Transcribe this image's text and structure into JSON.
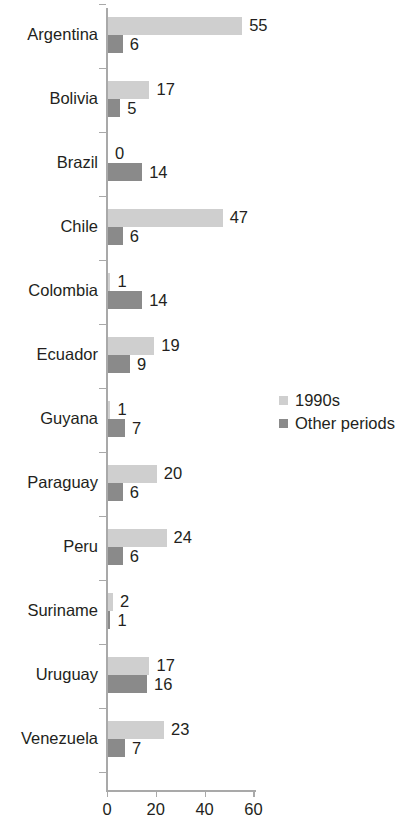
{
  "chart_data": {
    "type": "bar",
    "orientation": "horizontal",
    "title": "",
    "subtitle": "",
    "xlabel": "",
    "ylabel": "",
    "xlim": [
      0,
      64
    ],
    "xticks": [
      0,
      20,
      40,
      60
    ],
    "xtick_labels": [
      "0",
      "20",
      "40",
      "60"
    ],
    "grid": false,
    "legend_position": "center-right",
    "categories": [
      "Argentina",
      "Bolivia",
      "Brazil",
      "Chile",
      "Colombia",
      "Ecuador",
      "Guyana",
      "Paraguay",
      "Peru",
      "Suriname",
      "Uruguay",
      "Venezuela"
    ],
    "series": [
      {
        "name": "1990s",
        "color": "#cfcfcf",
        "values": [
          55,
          17,
          0,
          47,
          1,
          19,
          1,
          20,
          24,
          2,
          17,
          23
        ]
      },
      {
        "name": "Other periods",
        "color": "#8a8a8a",
        "values": [
          6,
          5,
          14,
          6,
          14,
          9,
          7,
          6,
          6,
          1,
          16,
          7
        ]
      }
    ]
  },
  "legend": {
    "items": [
      {
        "label": "1990s",
        "color": "#cfcfcf"
      },
      {
        "label": "Other periods",
        "color": "#8a8a8a"
      }
    ]
  },
  "axis": {
    "line_color": "#a9a9a9"
  }
}
